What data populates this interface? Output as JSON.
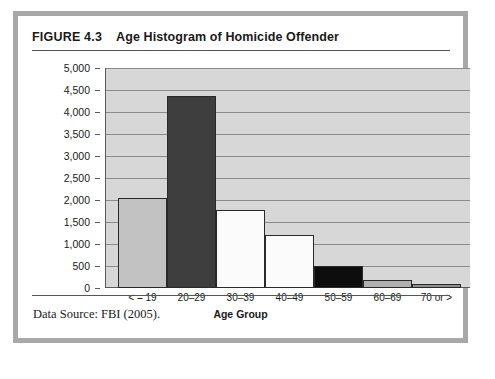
{
  "figure": {
    "number": "FIGURE 4.3",
    "title": "Age Histogram of Homicide Offender",
    "source_note": "Data Source: FBI (2005)."
  },
  "colors": {
    "frame_border": "#a8a8a8",
    "card_background": "#ffffff",
    "plot_background": "#d7d7d7",
    "gridline": "#8a8a8a",
    "axis": "#5a5a5a",
    "bar_outline": "#2a2a2a",
    "text": "#1a1a1a"
  },
  "chart_data": {
    "type": "bar",
    "title": "Age Histogram of Homicide Offender",
    "xlabel": "Age Group",
    "ylabel": "",
    "categories": [
      "< = 19",
      "20–29",
      "30–39",
      "40–49",
      "50–59",
      "60–69",
      "70 or >"
    ],
    "values": [
      2050,
      4370,
      1780,
      1200,
      490,
      180,
      90
    ],
    "bar_colors": [
      "#c2c2c2",
      "#3e3e3e",
      "#fbfbfb",
      "#fbfbfb",
      "#0d0d0d",
      "#b0b0b0",
      "#8e8e8e"
    ],
    "ylim": [
      0,
      5000
    ],
    "ytick_values": [
      0,
      500,
      1000,
      1500,
      2000,
      2500,
      3000,
      3500,
      4000,
      4500,
      5000
    ],
    "ytick_labels": [
      "0",
      "500",
      "1,000",
      "1,500",
      "2,000",
      "2,500",
      "3,000",
      "3,500",
      "4,000",
      "4,500",
      "5,000"
    ],
    "grid": true,
    "legend": false,
    "legend_position": "none"
  }
}
